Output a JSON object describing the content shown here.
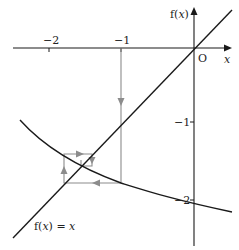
{
  "diagram": {
    "type": "cobweb-iteration",
    "axes": {
      "y_axis_label_prefix": "f(",
      "y_axis_label_var": "x",
      "y_axis_label_suffix": ")",
      "x_axis_label": "x",
      "origin_label": "O",
      "x_ticks": [
        {
          "value": -2,
          "label": "−2"
        },
        {
          "value": -1,
          "label": "−1"
        }
      ],
      "y_ticks": [
        {
          "value": -1,
          "label": "−1"
        },
        {
          "value": -2,
          "label": "−2"
        }
      ]
    },
    "line_label_prefix": "f(",
    "line_label_var": "x",
    "line_label_mid": ") = ",
    "line_label_rhs": "x",
    "colors": {
      "axes": "#1a1a1a",
      "curve": "#1a1a1a",
      "cobweb": "#8c8c8c"
    }
  }
}
